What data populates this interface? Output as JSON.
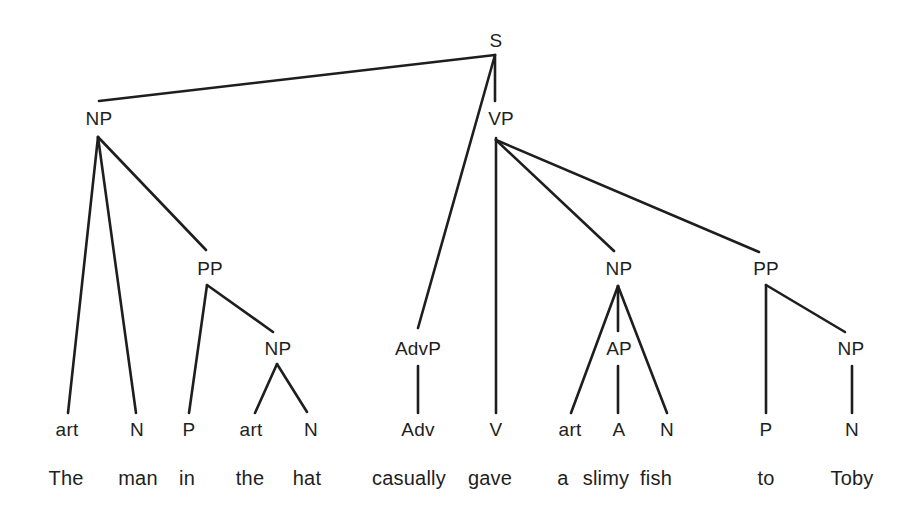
{
  "diagram": {
    "type": "syntax-tree",
    "sentence": "The man in the hat casually gave a slimy fish to Toby",
    "colors": {
      "ink": "#1e1e1e",
      "background": "#ffffff"
    },
    "nodes": [
      {
        "id": "S",
        "label": "S",
        "x": 496,
        "y": 40,
        "kind": "phrase"
      },
      {
        "id": "NP1",
        "label": "NP",
        "x": 99,
        "y": 118,
        "kind": "phrase"
      },
      {
        "id": "VP",
        "label": "VP",
        "x": 501,
        "y": 118,
        "kind": "phrase"
      },
      {
        "id": "PP1",
        "label": "PP",
        "x": 210,
        "y": 268,
        "kind": "phrase"
      },
      {
        "id": "NP2",
        "label": "NP",
        "x": 278,
        "y": 348,
        "kind": "phrase"
      },
      {
        "id": "AdvP",
        "label": "AdvP",
        "x": 418,
        "y": 348,
        "kind": "phrase"
      },
      {
        "id": "NP3",
        "label": "NP",
        "x": 619,
        "y": 268,
        "kind": "phrase"
      },
      {
        "id": "AP",
        "label": "AP",
        "x": 619,
        "y": 348,
        "kind": "phrase"
      },
      {
        "id": "PP2",
        "label": "PP",
        "x": 766,
        "y": 268,
        "kind": "phrase"
      },
      {
        "id": "NP4",
        "label": "NP",
        "x": 851,
        "y": 348,
        "kind": "phrase"
      },
      {
        "id": "art1",
        "label": "art",
        "x": 67,
        "y": 429,
        "kind": "category"
      },
      {
        "id": "N1",
        "label": "N",
        "x": 137,
        "y": 429,
        "kind": "category"
      },
      {
        "id": "P1",
        "label": "P",
        "x": 189,
        "y": 429,
        "kind": "category"
      },
      {
        "id": "art2",
        "label": "art",
        "x": 251,
        "y": 429,
        "kind": "category"
      },
      {
        "id": "N2",
        "label": "N",
        "x": 311,
        "y": 429,
        "kind": "category"
      },
      {
        "id": "Adv",
        "label": "Adv",
        "x": 418,
        "y": 429,
        "kind": "category"
      },
      {
        "id": "V",
        "label": "V",
        "x": 496,
        "y": 429,
        "kind": "category"
      },
      {
        "id": "art3",
        "label": "art",
        "x": 570,
        "y": 429,
        "kind": "category"
      },
      {
        "id": "A",
        "label": "A",
        "x": 619,
        "y": 429,
        "kind": "category"
      },
      {
        "id": "N3",
        "label": "N",
        "x": 667,
        "y": 429,
        "kind": "category"
      },
      {
        "id": "P2",
        "label": "P",
        "x": 766,
        "y": 429,
        "kind": "category"
      },
      {
        "id": "N4",
        "label": "N",
        "x": 852,
        "y": 429,
        "kind": "category"
      }
    ],
    "words": [
      {
        "text": "The",
        "x": 66,
        "y": 478
      },
      {
        "text": "man",
        "x": 138,
        "y": 478
      },
      {
        "text": "in",
        "x": 187,
        "y": 478
      },
      {
        "text": "the",
        "x": 250,
        "y": 478
      },
      {
        "text": "hat",
        "x": 307,
        "y": 478
      },
      {
        "text": "casually",
        "x": 409,
        "y": 478
      },
      {
        "text": "gave",
        "x": 490,
        "y": 478
      },
      {
        "text": "a",
        "x": 563,
        "y": 478
      },
      {
        "text": "slimy",
        "x": 606,
        "y": 478
      },
      {
        "text": "fish",
        "x": 656,
        "y": 478
      },
      {
        "text": "to",
        "x": 766,
        "y": 478
      },
      {
        "text": "Toby",
        "x": 852,
        "y": 478
      }
    ],
    "edges": [
      {
        "from": "S",
        "to": "NP1",
        "x1": 495,
        "y1": 55,
        "x2": 99,
        "y2": 101
      },
      {
        "from": "S",
        "to": "VP",
        "x1": 495,
        "y1": 55,
        "x2": 495,
        "y2": 101
      },
      {
        "from": "S",
        "to": "AdvP",
        "x1": 495,
        "y1": 55,
        "x2": 418,
        "y2": 328
      },
      {
        "from": "NP1",
        "to": "art1",
        "x1": 98,
        "y1": 137,
        "x2": 68,
        "y2": 413
      },
      {
        "from": "NP1",
        "to": "N1",
        "x1": 98,
        "y1": 137,
        "x2": 136,
        "y2": 413
      },
      {
        "from": "NP1",
        "to": "PP1",
        "x1": 98,
        "y1": 137,
        "x2": 206,
        "y2": 250
      },
      {
        "from": "PP1",
        "to": "P1",
        "x1": 207,
        "y1": 285,
        "x2": 189,
        "y2": 413
      },
      {
        "from": "PP1",
        "to": "NP2",
        "x1": 207,
        "y1": 285,
        "x2": 273,
        "y2": 332
      },
      {
        "from": "NP2",
        "to": "art2",
        "x1": 277,
        "y1": 364,
        "x2": 255,
        "y2": 413
      },
      {
        "from": "NP2",
        "to": "N2",
        "x1": 277,
        "y1": 364,
        "x2": 307,
        "y2": 412
      },
      {
        "from": "AdvP",
        "to": "Adv",
        "x1": 418,
        "y1": 366,
        "x2": 418,
        "y2": 413
      },
      {
        "from": "VP",
        "to": "V",
        "x1": 496,
        "y1": 138,
        "x2": 496,
        "y2": 413
      },
      {
        "from": "VP",
        "to": "NP3",
        "x1": 496,
        "y1": 140,
        "x2": 614,
        "y2": 251
      },
      {
        "from": "VP",
        "to": "PP2",
        "x1": 496,
        "y1": 140,
        "x2": 759,
        "y2": 252
      },
      {
        "from": "NP3",
        "to": "art3",
        "x1": 618,
        "y1": 286,
        "x2": 571,
        "y2": 413
      },
      {
        "from": "NP3",
        "to": "AP",
        "x1": 618,
        "y1": 286,
        "x2": 618,
        "y2": 331
      },
      {
        "from": "NP3",
        "to": "N3",
        "x1": 618,
        "y1": 286,
        "x2": 667,
        "y2": 413
      },
      {
        "from": "AP",
        "to": "A",
        "x1": 618,
        "y1": 366,
        "x2": 618,
        "y2": 413
      },
      {
        "from": "PP2",
        "to": "P2",
        "x1": 766,
        "y1": 285,
        "x2": 766,
        "y2": 413
      },
      {
        "from": "PP2",
        "to": "NP4",
        "x1": 766,
        "y1": 285,
        "x2": 845,
        "y2": 332
      },
      {
        "from": "NP4",
        "to": "N4",
        "x1": 852,
        "y1": 366,
        "x2": 852,
        "y2": 413
      }
    ]
  }
}
